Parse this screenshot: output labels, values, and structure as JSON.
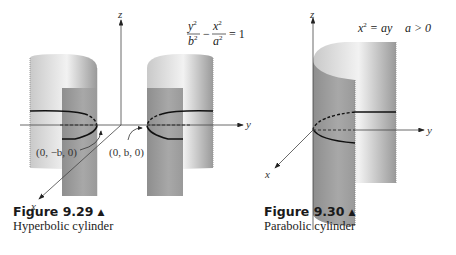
{
  "figures": [
    {
      "number": "Figure 9.29",
      "marker": "▲",
      "title": "Hyperbolic cylinder",
      "equation": {
        "term1_num": "y",
        "term1_den": "b",
        "term2_num": "x",
        "term2_den": "a",
        "exp": "2",
        "minus": "−",
        "rhs": "= 1"
      },
      "axes": {
        "x": "x",
        "y": "y",
        "z": "z"
      },
      "points": [
        "(0, −b, 0)",
        "(0, b, 0)"
      ]
    },
    {
      "number": "Figure 9.30",
      "marker": "▲",
      "title": "Parabolic cylinder",
      "equation": {
        "lhs": "x",
        "exp": "2",
        "rhs": " = ay",
        "condition": "a > 0"
      },
      "axes": {
        "x": "x",
        "y": "y",
        "z": "z"
      }
    }
  ]
}
